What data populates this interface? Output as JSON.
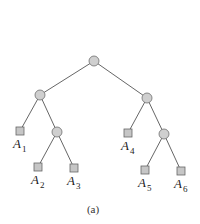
{
  "diagram": {
    "caption": "(a)",
    "nodes": {
      "root": {
        "x": 94,
        "y": 61,
        "type": "internal"
      },
      "n1": {
        "x": 40,
        "y": 95,
        "type": "internal"
      },
      "n2": {
        "x": 147,
        "y": 98,
        "type": "internal"
      },
      "n3": {
        "x": 57,
        "y": 132,
        "type": "internal"
      },
      "n4": {
        "x": 164,
        "y": 134,
        "type": "internal"
      },
      "A1": {
        "x": 20,
        "y": 131,
        "type": "leaf",
        "letter": "A",
        "sub": "1"
      },
      "A2": {
        "x": 38,
        "y": 167,
        "type": "leaf",
        "letter": "A",
        "sub": "2"
      },
      "A3": {
        "x": 74,
        "y": 168,
        "type": "leaf",
        "letter": "A",
        "sub": "3"
      },
      "A4": {
        "x": 128,
        "y": 133,
        "type": "leaf",
        "letter": "A",
        "sub": "4"
      },
      "A5": {
        "x": 145,
        "y": 170,
        "type": "leaf",
        "letter": "A",
        "sub": "5"
      },
      "A6": {
        "x": 181,
        "y": 171,
        "type": "leaf",
        "letter": "A",
        "sub": "6"
      }
    },
    "edges": [
      [
        "root",
        "n1"
      ],
      [
        "root",
        "n2"
      ],
      [
        "n1",
        "A1"
      ],
      [
        "n1",
        "n3"
      ],
      [
        "n3",
        "A2"
      ],
      [
        "n3",
        "A3"
      ],
      [
        "n2",
        "A4"
      ],
      [
        "n2",
        "n4"
      ],
      [
        "n4",
        "A5"
      ],
      [
        "n4",
        "A6"
      ]
    ]
  }
}
